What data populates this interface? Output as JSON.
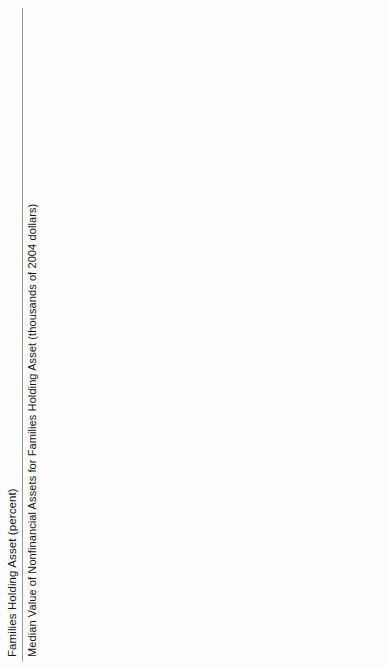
{
  "page": {
    "legend": [
      {
        "key": "vehicles",
        "label": "Vehicles",
        "color": "#c2c2c2"
      },
      {
        "key": "primary_residence",
        "label": "Primary residence",
        "color": "#4f4f4f"
      }
    ]
  },
  "chart_data": [
    {
      "type": "bar",
      "title": "Families Holding Asset (percent)",
      "ylabel": "",
      "xlabel": "",
      "ylim": [
        0,
        100
      ],
      "yticks": [
        "0",
        "20",
        "40",
        "60",
        "80",
        "100"
      ],
      "grid": false,
      "legend_position": "bottom",
      "series_names": [
        "Vehicles",
        "Primary residence"
      ],
      "panels": [
        {
          "name": "Income percentile",
          "categories": [
            "Bottom\nquintile",
            "Second\nquintile",
            "Third\nquintile",
            "Fourth\nquintile",
            "Fifth\nquintile"
          ],
          "series": [
            {
              "name": "Vehicles",
              "values": [
                65,
                84,
                91,
                93,
                93
              ]
            },
            {
              "name": "Primary residence",
              "values": [
                40,
                57,
                71,
                83,
                92
              ]
            }
          ]
        },
        {
          "name": "Education",
          "categories": [
            "Some high\nschool",
            "High school\ngraduate",
            "Some\ncollege",
            "College\ngraduate"
          ],
          "series": [
            {
              "name": "Vehicles",
              "values": [
                69,
                87,
                88,
                88
              ]
            },
            {
              "name": "Primary residence",
              "values": [
                57,
                62,
                63,
                79
              ]
            }
          ]
        },
        {
          "name": "Age group",
          "categories": [
            "Less\nthan 35",
            "35–44",
            "45–54",
            "55–64",
            "65–74",
            "75 or\nmore"
          ],
          "series": [
            {
              "name": "Vehicles",
              "values": [
                83,
                87,
                89,
                88,
                88,
                79
              ]
            },
            {
              "name": "Primary residence",
              "values": [
                42,
                69,
                78,
                80,
                81,
                81
              ]
            }
          ]
        }
      ]
    },
    {
      "type": "bar",
      "title": "Median Value of Nonfinancial Assets for Families Holding Asset (thousands of 2004 dollars)",
      "ylabel": "",
      "xlabel": "",
      "ylim": [
        0,
        350
      ],
      "yticks": [
        "$0",
        "$50",
        "$100",
        "$150",
        "$200",
        "$250",
        "$300",
        "$350"
      ],
      "grid": false,
      "legend_position": "bottom",
      "series_names": [
        "Vehicles",
        "Primary residence"
      ],
      "panels": [
        {
          "name": "Income percentile",
          "categories": [
            "Bottom\nquintile",
            "Second\nquintile",
            "Third\nquintile",
            "Fourth\nquintile",
            "Fifth\nquintile"
          ],
          "series": [
            {
              "name": "Vehicles",
              "values": [
                4,
                6,
                9,
                14,
                20
              ]
            },
            {
              "name": "Primary residence",
              "values": [
                70,
                100,
                135,
                170,
                345
              ]
            }
          ]
        },
        {
          "name": "Education",
          "categories": [
            "Some high\nschool",
            "High school\ngraduate",
            "Some\ncollege",
            "College\ngraduate"
          ],
          "series": [
            {
              "name": "Vehicles",
              "values": [
                5,
                9,
                10,
                14
              ]
            },
            {
              "name": "Primary residence",
              "values": [
                75,
                120,
                150,
                250
              ]
            }
          ]
        },
        {
          "name": "Age group",
          "categories": [
            "Less\nthan 35",
            "35–44",
            "45–54",
            "55–64",
            "65–74",
            "75 or\nmore"
          ],
          "series": [
            {
              "name": "Vehicles",
              "values": [
                10,
                12,
                13,
                14,
                10,
                7
              ]
            },
            {
              "name": "Primary residence",
              "values": [
                130,
                145,
                165,
                200,
                150,
                125
              ]
            }
          ]
        }
      ]
    }
  ]
}
